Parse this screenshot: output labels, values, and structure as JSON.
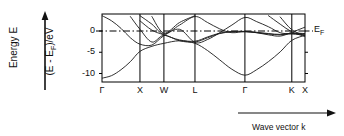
{
  "figure": {
    "axis_label_energy": "Energy E",
    "axis_label_energy_inner_pre": "(E - E",
    "axis_label_energy_inner_sub": "F",
    "axis_label_energy_inner_post": ")/eV",
    "axis_label_wavevector": "Wave vector k",
    "fermi_label_main": "E",
    "fermi_label_sub": "F",
    "line_color": "#1a1a1a",
    "frame_color": "#000000",
    "background": "#ffffff"
  },
  "chart_data": {
    "type": "line",
    "title": "",
    "subtitle": "",
    "xlabel": "Wave vector k",
    "ylabel": "(E - E_F)/eV",
    "grid": true,
    "legend": false,
    "ylim": [
      -12,
      4
    ],
    "yticks": [
      0,
      -5,
      -10
    ],
    "ytick_labels": [
      "0",
      "-5",
      "-10"
    ],
    "xlim": [
      0,
      1
    ],
    "high_symmetry_points": [
      "Γ",
      "X",
      "W",
      "L",
      "Γ",
      "K",
      "X"
    ],
    "high_symmetry_positions": [
      0.0,
      0.187,
      0.305,
      0.458,
      0.704,
      0.935,
      1.0
    ],
    "annotations": [
      {
        "text": "E_F",
        "x": 1.02,
        "y": 0.0,
        "note": "Fermi level dash-dot reference line"
      }
    ],
    "reference_lines": [
      {
        "axis": "y",
        "value": 0.0,
        "style": "dash-dot",
        "label": "E_F"
      }
    ],
    "series": [
      {
        "name": "band-1-valence-sp",
        "x": [
          0.0,
          0.047,
          0.094,
          0.14,
          0.187,
          0.246,
          0.305,
          0.382,
          0.458,
          0.52,
          0.58,
          0.64,
          0.704,
          0.762,
          0.82,
          0.878,
          0.935,
          1.0
        ],
        "values": [
          -11.1,
          -10.5,
          -9.1,
          -7.2,
          -4.8,
          -3.6,
          -2.9,
          -2.3,
          -2.9,
          -4.6,
          -6.8,
          -9.0,
          -10.4,
          -9.1,
          -7.2,
          -4.9,
          -2.2,
          -1.0
        ]
      },
      {
        "name": "band-2-lower-d",
        "x": [
          0.0,
          0.047,
          0.094,
          0.14,
          0.187,
          0.246,
          0.305,
          0.382,
          0.458,
          0.52,
          0.58,
          0.64,
          0.704,
          0.762,
          0.82,
          0.878,
          0.935,
          1.0
        ],
        "values": [
          3.6,
          2.4,
          0.6,
          -1.6,
          -3.1,
          -3.3,
          -1.1,
          0.4,
          -2.7,
          -2.0,
          -0.4,
          1.4,
          3.2,
          2.2,
          1.0,
          -0.4,
          -0.7,
          -0.9
        ]
      },
      {
        "name": "band-3-d-band",
        "x": [
          0.14,
          0.187,
          0.246,
          0.305,
          0.382,
          0.458,
          0.52,
          0.58,
          0.64,
          0.704,
          0.762,
          0.82,
          0.878,
          0.935,
          1.0
        ],
        "values": [
          3.4,
          0.4,
          -2.6,
          -1.0,
          -2.3,
          -2.6,
          -1.6,
          -0.6,
          -0.2,
          -0.2,
          -0.4,
          -0.7,
          -0.9,
          -0.6,
          -0.7
        ]
      },
      {
        "name": "band-4-d-band",
        "x": [
          0.187,
          0.246,
          0.305,
          0.382,
          0.458,
          0.52,
          0.58,
          0.64,
          0.704,
          0.762,
          0.82,
          0.878,
          0.935,
          1.0
        ],
        "values": [
          2.4,
          0.2,
          -0.9,
          -2.1,
          -2.4,
          -1.4,
          -0.5,
          -0.1,
          -0.1,
          -0.3,
          -0.6,
          -0.8,
          -0.5,
          -0.6
        ]
      },
      {
        "name": "band-5-upper-sp",
        "x": [
          0.187,
          0.246,
          0.305,
          0.382,
          0.458,
          0.52,
          0.58,
          0.64,
          0.704,
          0.762,
          0.82,
          0.878,
          0.935,
          1.0
        ],
        "values": [
          3.6,
          1.6,
          -0.7,
          1.4,
          3.4,
          2.0,
          0.5,
          -0.4,
          -0.1,
          -0.4,
          -0.9,
          -1.2,
          -0.3,
          0.9
        ]
      },
      {
        "name": "band-6-upper-branch",
        "x": [
          0.246,
          0.305,
          0.382,
          0.458
        ],
        "values": [
          3.4,
          -0.5,
          2.0,
          3.6
        ]
      },
      {
        "name": "band-7-right-crossing",
        "x": [
          0.82,
          0.878,
          0.935,
          1.0
        ],
        "values": [
          3.6,
          1.6,
          -0.2,
          -1.3
        ]
      },
      {
        "name": "band-8-right-rising",
        "x": [
          0.878,
          0.935,
          1.0
        ],
        "values": [
          3.3,
          0.3,
          -1.1
        ]
      }
    ]
  }
}
